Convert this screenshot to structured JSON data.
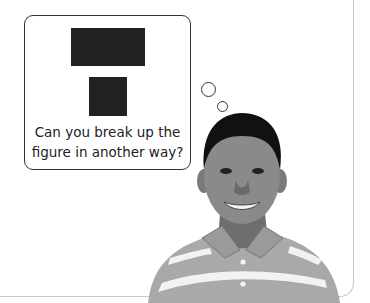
{
  "thought_bubble": {
    "caption_line1": "Can you break up the",
    "caption_line2": "figure in another way?",
    "figure": {
      "top_rectangle_color": "#222222",
      "bottom_square_color": "#222222"
    }
  },
  "illustration": {
    "subject": "smiling boy in striped polo shirt",
    "icon": "person-photo"
  }
}
